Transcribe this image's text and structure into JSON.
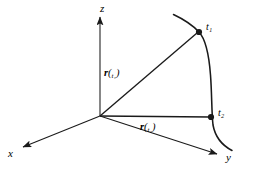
{
  "figure": {
    "type": "vector-position-diagram",
    "background_color": "#ffffff",
    "stroke_color": "#1a1a1a",
    "axes": [
      {
        "id": "z",
        "label": "z",
        "label_x": 100,
        "label_y": 3,
        "from": [
          100,
          116
        ],
        "to": [
          100,
          17
        ],
        "arrow": true
      },
      {
        "id": "x",
        "label": "x",
        "label_x": 8,
        "label_y": 148,
        "from": [
          100,
          116
        ],
        "to": [
          23,
          147
        ],
        "arrow": true
      },
      {
        "id": "y",
        "label": "y",
        "label_x": 226,
        "label_y": 152,
        "from": [
          100,
          116
        ],
        "to": [
          217,
          154
        ],
        "arrow": true
      }
    ],
    "origin": {
      "x": 100,
      "y": 116
    },
    "vectors": [
      {
        "id": "r-t1",
        "name": "r",
        "subscript": "t₁",
        "label_text": "r(t₁)",
        "label_x": 104,
        "label_y": 68,
        "from": [
          100,
          116
        ],
        "to": [
          197,
          33
        ],
        "arrow": false
      },
      {
        "id": "r-t2",
        "name": "r",
        "subscript": "t₂",
        "label_text": "r(t₂)",
        "label_x": 140,
        "label_y": 122,
        "from": [
          100,
          116
        ],
        "to": [
          210,
          117
        ],
        "arrow": false
      }
    ],
    "points": [
      {
        "id": "t1",
        "label": "t₁",
        "x": 199,
        "y": 32,
        "label_x": 206,
        "label_y": 22,
        "radius": 3.1
      },
      {
        "id": "t2",
        "label": "t₂",
        "x": 211,
        "y": 117,
        "label_x": 218,
        "label_y": 108,
        "radius": 3.1
      }
    ],
    "curve": {
      "id": "trajectory-curve",
      "path": "M 173.5,14.5 C 182,18.5 192,24.5 199,32 C 206,39.5 209,55 210.5,75 C 212,95 211.5,112 213,125 C 215,136 221.5,145 232,150.5",
      "stroke_width": 1.5
    }
  }
}
